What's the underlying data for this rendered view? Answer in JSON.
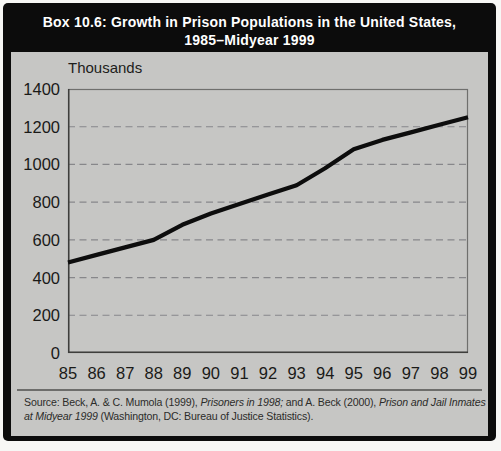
{
  "box": {
    "title_line1": "Box 10.6: Growth in Prison Populations in the United States,",
    "title_line2": "1985–Midyear 1999"
  },
  "chart_data": {
    "type": "line",
    "title": "Box 10.6: Growth in Prison Populations in the United States, 1985–Midyear 1999",
    "unit_label": "Thousands",
    "xlabel": "",
    "ylabel": "Thousands",
    "categories": [
      "85",
      "86",
      "87",
      "88",
      "89",
      "90",
      "91",
      "92",
      "93",
      "94",
      "95",
      "96",
      "97",
      "98",
      "99"
    ],
    "series": [
      {
        "name": "Prison population (thousands)",
        "values": [
          480,
          520,
          560,
          600,
          680,
          740,
          790,
          840,
          890,
          980,
          1080,
          1130,
          1170,
          1210,
          1250
        ]
      }
    ],
    "ylim": [
      0,
      1400
    ],
    "yticks": [
      0,
      200,
      400,
      600,
      800,
      1000,
      1200,
      1400
    ],
    "grid": "horizontal-dashed",
    "legend_position": "none",
    "line_color": "#0d0d0d",
    "plot_bg": "#c6c6c4",
    "grid_color": "#87878a",
    "frame_color": "#6f6f6d"
  },
  "source": {
    "prefix": "Source: Beck, A. & C. Mumola (1999), ",
    "work1": "Prisoners in 1998;",
    "middle": " and A. Beck (2000), ",
    "work2": "Prison and Jail Inmates at Midyear 1999",
    "suffix": " (Washington, DC: Bureau of Justice Statistics)."
  }
}
